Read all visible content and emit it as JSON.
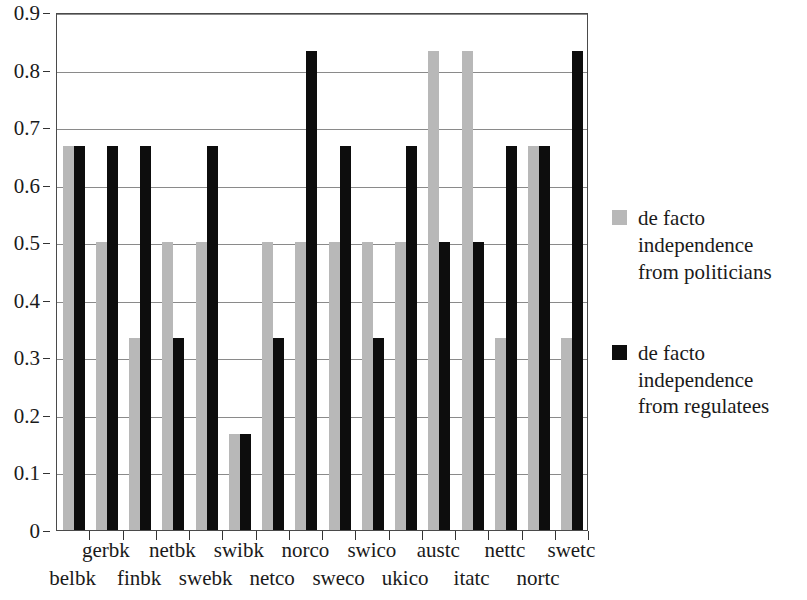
{
  "chart_data": {
    "type": "bar",
    "title": "",
    "subtitle": "",
    "xlabel": "",
    "ylabel": "",
    "ylim": [
      0,
      0.9
    ],
    "grid": true,
    "grid_axis": "y",
    "legend_position": "right",
    "bar_orientation": "vertical",
    "categories": [
      "belbk",
      "gerbk",
      "finbk",
      "netbk",
      "swebk",
      "swibk",
      "netco",
      "norco",
      "sweco",
      "swico",
      "ukico",
      "austc",
      "itatc",
      "nettc",
      "nortc",
      "swetc"
    ],
    "category_label_rows": [
      1,
      0,
      1,
      0,
      1,
      0,
      1,
      0,
      1,
      0,
      1,
      0,
      1,
      0,
      1,
      0
    ],
    "y_ticks": [
      "0",
      "0.1",
      "0.2",
      "0.3",
      "0.4",
      "0.5",
      "0.6",
      "0.7",
      "0.8",
      "0.9"
    ],
    "y_tick_values": [
      0,
      0.1,
      0.2,
      0.3,
      0.4,
      0.5,
      0.6,
      0.7,
      0.8,
      0.9
    ],
    "series": [
      {
        "name": "de facto independence from politicians",
        "color": "#b8b8b8",
        "values": [
          0.667,
          0.5,
          0.333,
          0.5,
          0.5,
          0.167,
          0.5,
          0.5,
          0.5,
          0.5,
          0.5,
          0.833,
          0.833,
          0.333,
          0.667,
          0.333
        ]
      },
      {
        "name": "de facto independence from regulatees",
        "color": "#0d0d0d",
        "values": [
          0.667,
          0.667,
          0.667,
          0.333,
          0.667,
          0.167,
          0.333,
          0.833,
          0.667,
          0.333,
          0.667,
          0.5,
          0.5,
          0.667,
          0.667,
          0.833
        ]
      }
    ]
  },
  "legend": {
    "entries": [
      {
        "swatch": "gray",
        "line1": "de facto",
        "line2": "independence",
        "line3": "from politicians"
      },
      {
        "swatch": "black",
        "line1": "de facto",
        "line2": "independence",
        "line3": "from regulatees"
      }
    ]
  }
}
